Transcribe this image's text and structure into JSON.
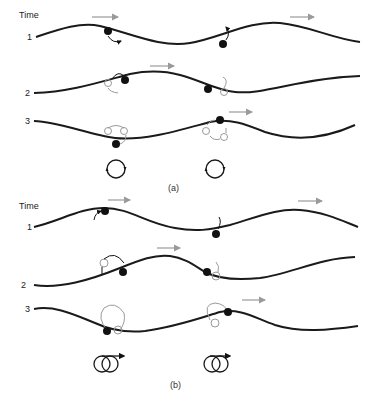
{
  "figure": {
    "panel_a": {
      "time_label": "Time",
      "rows": [
        {
          "label": "1"
        },
        {
          "label": "2"
        },
        {
          "label": "3"
        }
      ],
      "caption": "(a)",
      "orbit": "circular",
      "orbit_count": 2
    },
    "panel_b": {
      "time_label": "Time",
      "rows": [
        {
          "label": "1"
        },
        {
          "label": "2"
        },
        {
          "label": "3"
        }
      ],
      "caption": "(b)",
      "orbit": "looping-drift",
      "orbit_count": 2
    },
    "colors": {
      "wave": "#1a1a1a",
      "particle": "#111111",
      "ghost_particle": "#9a9a9a",
      "arrow": "#9a9a9a"
    }
  }
}
